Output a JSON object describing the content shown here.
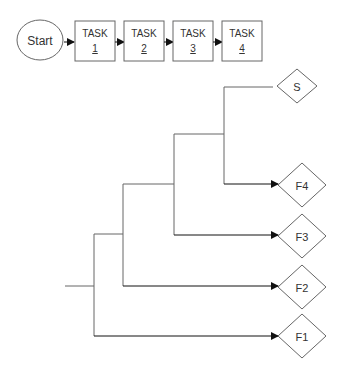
{
  "flow": {
    "start": {
      "label": "Start"
    },
    "tasks": [
      {
        "title": "TASK",
        "number": "1"
      },
      {
        "title": "TASK",
        "number": "2"
      },
      {
        "title": "TASK",
        "number": "3"
      },
      {
        "title": "TASK",
        "number": "4"
      }
    ]
  },
  "tree": {
    "outcomes": [
      {
        "label": "S"
      },
      {
        "label": "F4"
      },
      {
        "label": "F3"
      },
      {
        "label": "F2"
      },
      {
        "label": "F1"
      }
    ]
  },
  "colors": {
    "stroke": "#666666",
    "arrow": "#111111",
    "text": "#333333"
  }
}
